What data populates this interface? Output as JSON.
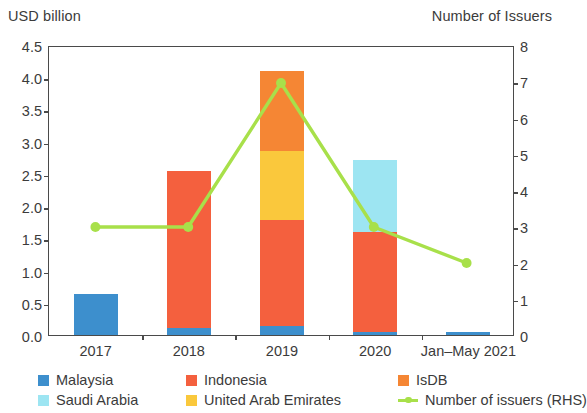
{
  "chart_data": {
    "type": "bar",
    "title": "",
    "subtitle": "",
    "ylabel": "USD billion",
    "ylabel_right": "Number of Issuers",
    "xlabel": "",
    "categories": [
      "2017",
      "2018",
      "2019",
      "2020",
      "Jan–May 2021"
    ],
    "ylim": [
      0,
      4.5
    ],
    "ylim_right": [
      0,
      8
    ],
    "yticks": [
      "0.0",
      "0.5",
      "1.0",
      "1.5",
      "2.0",
      "2.5",
      "3.0",
      "3.5",
      "4.0",
      "4.5"
    ],
    "ytick_values": [
      0,
      0.5,
      1.0,
      1.5,
      2.0,
      2.5,
      3.0,
      3.5,
      4.0,
      4.5
    ],
    "yticks_right": [
      "0",
      "1",
      "2",
      "3",
      "4",
      "5",
      "6",
      "7",
      "8"
    ],
    "ytick_values_right": [
      0,
      1,
      2,
      3,
      4,
      5,
      6,
      7,
      8
    ],
    "grid": false,
    "stacked": true,
    "legend_position": "bottom",
    "series": [
      {
        "name": "Malaysia",
        "color": "#3D8FCD",
        "axis": "left",
        "kind": "bar",
        "values": [
          0.63,
          0.11,
          0.14,
          0.05,
          0.05
        ]
      },
      {
        "name": "Indonesia",
        "color": "#F4603E",
        "axis": "left",
        "kind": "bar",
        "values": [
          0,
          2.44,
          1.65,
          1.55,
          0
        ]
      },
      {
        "name": "IsDB",
        "color": "#F58634",
        "axis": "left",
        "kind": "bar",
        "values": [
          0,
          0,
          1.25,
          0,
          0
        ]
      },
      {
        "name": "Saudi Arabia",
        "color": "#9DE5F2",
        "axis": "left",
        "kind": "bar",
        "values": [
          0,
          0,
          0,
          1.12,
          0
        ]
      },
      {
        "name": "United Arab Emirates",
        "color": "#FAC83C",
        "axis": "left",
        "kind": "bar",
        "values": [
          0,
          0,
          1.06,
          0,
          0
        ]
      },
      {
        "name": "Number of issuers (RHS)",
        "color": "#A8E04A",
        "axis": "right",
        "kind": "line",
        "values": [
          3,
          3,
          7,
          3,
          2
        ]
      }
    ],
    "stack_order": [
      "Malaysia",
      "Indonesia",
      "United Arab Emirates",
      "IsDB",
      "Saudi Arabia"
    ],
    "bar_totals": [
      0.63,
      2.55,
      4.1,
      2.72,
      0.05
    ]
  },
  "legend": {
    "entries": [
      {
        "label": "Malaysia",
        "color": "#3D8FCD",
        "marker": "square"
      },
      {
        "label": "Indonesia",
        "color": "#F4603E",
        "marker": "square"
      },
      {
        "label": "IsDB",
        "color": "#F58634",
        "marker": "square"
      },
      {
        "label": "Saudi Arabia",
        "color": "#9DE5F2",
        "marker": "square"
      },
      {
        "label": "United Arab Emirates",
        "color": "#FAC83C",
        "marker": "square"
      },
      {
        "label": "Number of issuers (RHS)",
        "color": "#A8E04A",
        "marker": "line"
      }
    ]
  }
}
